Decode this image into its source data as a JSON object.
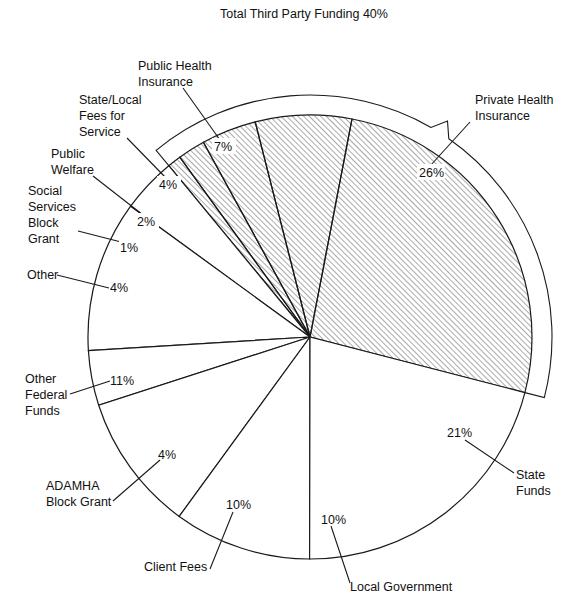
{
  "chart_data": {
    "type": "pie",
    "title": "",
    "bracket": {
      "label": "Total Third Party Funding 40%",
      "value": 40
    },
    "center": [
      310,
      337
    ],
    "radius": 222,
    "start_angle_deg": -14.5,
    "slices": [
      {
        "name": "Private Health Insurance",
        "label_lines": [
          "Private Health",
          "Insurance"
        ],
        "value": 26,
        "pct": "26%",
        "hatched": true
      },
      {
        "name": "Public Health Insurance",
        "label_lines": [
          "Public Health",
          "Insurance"
        ],
        "value": 7,
        "pct": "7%",
        "hatched": true
      },
      {
        "name": "State/Local Fees for Service",
        "label_lines": [
          "State/Local",
          "Fees for",
          "Service"
        ],
        "value": 4,
        "pct": "4%",
        "hatched": true
      },
      {
        "name": "Public Welfare",
        "label_lines": [
          "Public",
          "Welfare"
        ],
        "value": 2,
        "pct": "2%",
        "hatched": true
      },
      {
        "name": "Social Services Block Grant",
        "label_lines": [
          "Social",
          "Services",
          "Block",
          "Grant"
        ],
        "value": 1,
        "pct": "1%",
        "hatched": true
      },
      {
        "name": "Other",
        "label_lines": [
          "Other"
        ],
        "value": 4,
        "pct": "4%",
        "hatched": false
      },
      {
        "name": "Other Federal Funds",
        "label_lines": [
          "Other",
          "Federal",
          "Funds"
        ],
        "value": 11,
        "pct": "11%",
        "hatched": false
      },
      {
        "name": "ADAMHA Block Grant",
        "label_lines": [
          "ADAMHA",
          "Block Grant"
        ],
        "value": 4,
        "pct": "4%",
        "hatched": false
      },
      {
        "name": "Client Fees",
        "label_lines": [
          "Client Fees"
        ],
        "value": 10,
        "pct": "10%",
        "hatched": false
      },
      {
        "name": "Local Government",
        "label_lines": [
          "Local Government"
        ],
        "value": 10,
        "pct": "10%",
        "hatched": false
      },
      {
        "name": "State Funds",
        "label_lines": [
          "State",
          "Funds"
        ],
        "value": 21,
        "pct": "21%",
        "hatched": false
      }
    ],
    "categories": [
      "Private Health Insurance",
      "Public Health Insurance",
      "State/Local Fees for Service",
      "Public Welfare",
      "Social Services Block Grant",
      "Other",
      "Other Federal Funds",
      "ADAMHA Block Grant",
      "Client Fees",
      "Local Government",
      "State Funds"
    ],
    "values": [
      26,
      7,
      4,
      2,
      1,
      4,
      11,
      4,
      10,
      10,
      21
    ],
    "colors": {
      "stroke": "#1a1a1a",
      "hatch": "#555555",
      "background": "#ffffff"
    },
    "legend": "none (callout labels)"
  },
  "labels": {
    "bracket": "Total Third Party Funding 40%",
    "private_health": [
      "Private Health",
      "Insurance"
    ],
    "public_health": [
      "Public Health",
      "Insurance"
    ],
    "state_local_fees": [
      "State/Local",
      "Fees for",
      "Service"
    ],
    "public_welfare": [
      "Public",
      "Welfare"
    ],
    "social_services": [
      "Social",
      "Services",
      "Block",
      "Grant"
    ],
    "other": [
      "Other"
    ],
    "other_federal": [
      "Other",
      "Federal",
      "Funds"
    ],
    "adamha": [
      "ADAMHA",
      "Block Grant"
    ],
    "client_fees": [
      "Client Fees"
    ],
    "local_gov": [
      "Local Government"
    ],
    "state_funds": [
      "State",
      "Funds"
    ],
    "pcts": {
      "private_health": "26%",
      "public_health": "7%",
      "state_local_fees": "4%",
      "public_welfare": "2%",
      "social_services": "1%",
      "other": "4%",
      "other_federal": "11%",
      "adamha": "4%",
      "client_fees": "10%",
      "local_gov": "10%",
      "state_funds": "21%"
    }
  }
}
